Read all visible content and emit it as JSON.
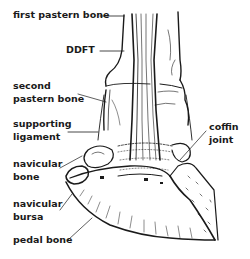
{
  "diagram": {
    "labels": {
      "first_pastern_bone": "first pastern bone",
      "ddft": "DDFT",
      "second_pastern_bone_line1": "second",
      "second_pastern_bone_line2": "pastern bone",
      "supporting_ligament_line1": "supporting",
      "supporting_ligament_line2": "ligament",
      "navicular_bone_line1": "navicular",
      "navicular_bone_line2": "bone",
      "navicular_bursa_line1": "navicular",
      "navicular_bursa_line2": "bursa",
      "pedal_bone": "pedal bone",
      "coffin_joint_line1": "coffin",
      "coffin_joint_line2": "joint"
    },
    "colors": {
      "ink": "#1a1a1a",
      "background": "#ffffff"
    }
  }
}
